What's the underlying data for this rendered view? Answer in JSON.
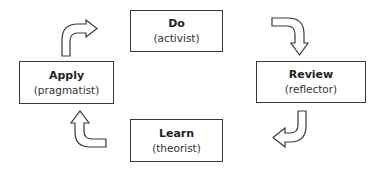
{
  "diagram": {
    "type": "cycle",
    "stages": [
      {
        "id": "do",
        "title": "Do",
        "subtitle": "(activist)"
      },
      {
        "id": "review",
        "title": "Review",
        "subtitle": "(reflector)"
      },
      {
        "id": "learn",
        "title": "Learn",
        "subtitle": "(theorist)"
      },
      {
        "id": "apply",
        "title": "Apply",
        "subtitle": "(pragmatist)"
      }
    ],
    "arrows": [
      {
        "from": "apply",
        "to": "do",
        "icon": "curved-arrow-right-icon"
      },
      {
        "from": "do",
        "to": "review",
        "icon": "curved-arrow-down-icon"
      },
      {
        "from": "review",
        "to": "learn",
        "icon": "curved-arrow-left-icon"
      },
      {
        "from": "learn",
        "to": "apply",
        "icon": "curved-arrow-up-icon"
      }
    ],
    "colors": {
      "stroke": "#3a3a3a",
      "fill": "#ffffff",
      "text": "#1f1f1f"
    }
  }
}
